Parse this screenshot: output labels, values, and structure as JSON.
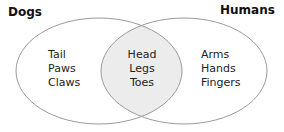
{
  "diagram": {
    "type": "venn",
    "sets": [
      {
        "label": "Dogs",
        "items": [
          "Tail",
          "Paws",
          "Claws"
        ]
      },
      {
        "label": "Humans",
        "items": [
          "Arms",
          "Hands",
          "Fingers"
        ]
      }
    ],
    "intersection": {
      "items": [
        "Head",
        "Legs",
        "Toes"
      ]
    },
    "colors": {
      "outline": "#9a9a9a",
      "intersection_fill": "#ececec",
      "background": "#ffffff"
    }
  }
}
